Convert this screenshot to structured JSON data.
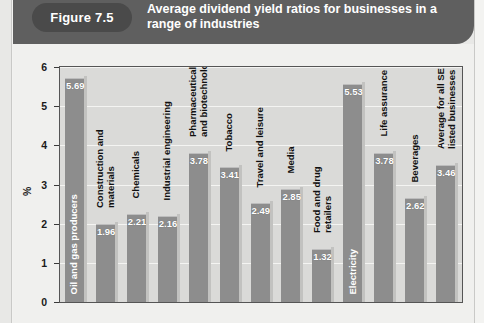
{
  "header": {
    "badge_label": "Figure 7.5",
    "title": "Average dividend yield ratios for businesses in a range of industries"
  },
  "chart_data": {
    "type": "bar",
    "title": "Average dividend yield ratios for businesses in a range of industries",
    "xlabel": "",
    "ylabel": "%",
    "ylim": [
      0,
      6
    ],
    "yticks": [
      0,
      1,
      2,
      3,
      4,
      5,
      6
    ],
    "ytick_labels": [
      "0",
      "1",
      "2",
      "3",
      "4",
      "5",
      "6"
    ],
    "grid": true,
    "legend": "none",
    "bar_color": "#8d8d8d",
    "plot_background": "#dadad8",
    "categories": [
      "Oil and gas producers",
      "Construction and materials",
      "Chemicals",
      "Industrial engineering",
      "Pharmaceuticals and biotechnology",
      "Tobacco",
      "Travel and leisure",
      "Media",
      "Food and drug retailers",
      "Electricity",
      "Life assurance",
      "Beverages",
      "Average for all SE listed businesses"
    ],
    "values": [
      5.69,
      1.96,
      2.21,
      2.16,
      3.78,
      3.41,
      2.49,
      2.85,
      1.32,
      5.53,
      3.78,
      2.62,
      3.46
    ],
    "value_labels": [
      "5.69",
      "1.96",
      "2.21",
      "2.16",
      "3.78",
      "3.41",
      "2.49",
      "2.85",
      "1.32",
      "5.53",
      "3.78",
      "2.62",
      "3.46"
    ],
    "label_lines": [
      [
        "Oil and gas producers"
      ],
      [
        "Construction and",
        "materials"
      ],
      [
        "Chemicals"
      ],
      [
        "Industrial engineering"
      ],
      [
        "Pharmaceuticals",
        "and biotechnology"
      ],
      [
        "Tobacco"
      ],
      [
        "Travel and leisure"
      ],
      [
        "Media"
      ],
      [
        "Food and drug",
        "retailers"
      ],
      [
        "Electricity"
      ],
      [
        "Life assurance"
      ],
      [
        "Beverages"
      ],
      [
        "Average for all SE",
        "listed businesses"
      ]
    ],
    "label_placement": [
      "inside",
      "outside",
      "outside",
      "outside",
      "outside",
      "outside",
      "outside",
      "outside",
      "outside",
      "inside",
      "outside",
      "outside",
      "outside"
    ]
  }
}
